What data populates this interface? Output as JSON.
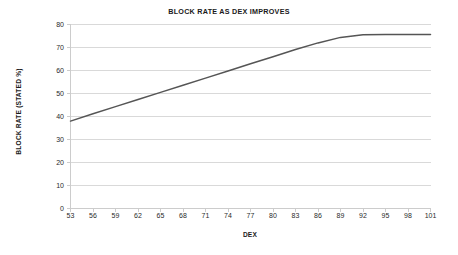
{
  "chart_data": {
    "type": "line",
    "title": "BLOCK RATE AS DEX IMPROVES",
    "xlabel": "DEX",
    "ylabel": "BLOCK RATE (STATED %)",
    "xlim": [
      53,
      101
    ],
    "ylim": [
      0,
      80
    ],
    "grid": true,
    "legend": "none",
    "line_color": "#555555",
    "gridline_color": "#d9d9d9",
    "axis_color": "#bfbfbf",
    "background_color": "#ffffff",
    "x_tick_labels": [
      "53",
      "56",
      "59",
      "62",
      "65",
      "68",
      "71",
      "74",
      "77",
      "80",
      "83",
      "86",
      "89",
      "92",
      "95",
      "98",
      "101"
    ],
    "x_ticks": [
      53,
      56,
      59,
      62,
      65,
      68,
      71,
      74,
      77,
      80,
      83,
      86,
      89,
      92,
      95,
      98,
      101
    ],
    "y_tick_labels": [
      "0",
      "10",
      "20",
      "30",
      "40",
      "50",
      "60",
      "70",
      "80"
    ],
    "y_ticks": [
      0,
      10,
      20,
      30,
      40,
      50,
      60,
      70,
      80
    ],
    "series": [
      {
        "name": "Block rate",
        "x": [
          53,
          56,
          59,
          62,
          65,
          68,
          71,
          74,
          77,
          80,
          83,
          86,
          89,
          92,
          95,
          98,
          101
        ],
        "values": [
          38.0,
          41.2,
          44.3,
          47.4,
          50.5,
          53.6,
          56.7,
          59.8,
          62.9,
          66.0,
          69.1,
          72.0,
          74.4,
          75.5,
          75.7,
          75.7,
          75.7
        ]
      }
    ]
  }
}
